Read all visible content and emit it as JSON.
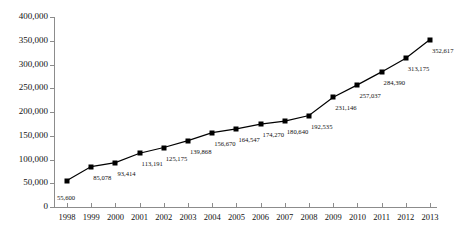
{
  "chart_data": {
    "type": "line",
    "title": "",
    "xlabel": "",
    "ylabel": "",
    "categories": [
      "1998",
      "1999",
      "2000",
      "2001",
      "2002",
      "2003",
      "2004",
      "2005",
      "2006",
      "2007",
      "2008",
      "2009",
      "2010",
      "2011",
      "2012",
      "2013"
    ],
    "values": [
      55600,
      85078,
      93414,
      113191,
      125175,
      139868,
      156670,
      164547,
      174270,
      180640,
      192535,
      231146,
      257037,
      284390,
      313175,
      352617
    ],
    "value_labels": [
      "55,600",
      "85,078",
      "93,414",
      "113,191",
      "125,175",
      "139,868",
      "156,670",
      "164,547",
      "174,270",
      "180,640",
      "192,535",
      "231,146",
      "257,037",
      "284,390",
      "313,175",
      "352,617"
    ],
    "ylim": [
      0,
      400000
    ],
    "ytick_labels": [
      "400,000",
      "350,000",
      "300,000",
      "250,000",
      "200,000",
      "150,000",
      "100,000",
      "50,000",
      "0"
    ],
    "ytick_values": [
      400000,
      350000,
      300000,
      250000,
      200000,
      150000,
      100000,
      50000,
      0
    ],
    "grid": false,
    "legend": null,
    "marker": "square",
    "series_color": "#000000",
    "axis_color": "#8c8c8c"
  }
}
